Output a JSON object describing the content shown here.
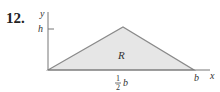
{
  "problem_number": "12.",
  "diagram": {
    "axes": {
      "x_label": "x",
      "y_label": "y"
    },
    "y_tick_label": "h",
    "x_tick_labels": {
      "half_numer": "1",
      "half_denom": "2",
      "half_var": "b",
      "end": "b"
    },
    "region_label": "R",
    "colors": {
      "fill": "#e6e6e6",
      "stroke": "#888888",
      "axis": "#777777"
    }
  }
}
